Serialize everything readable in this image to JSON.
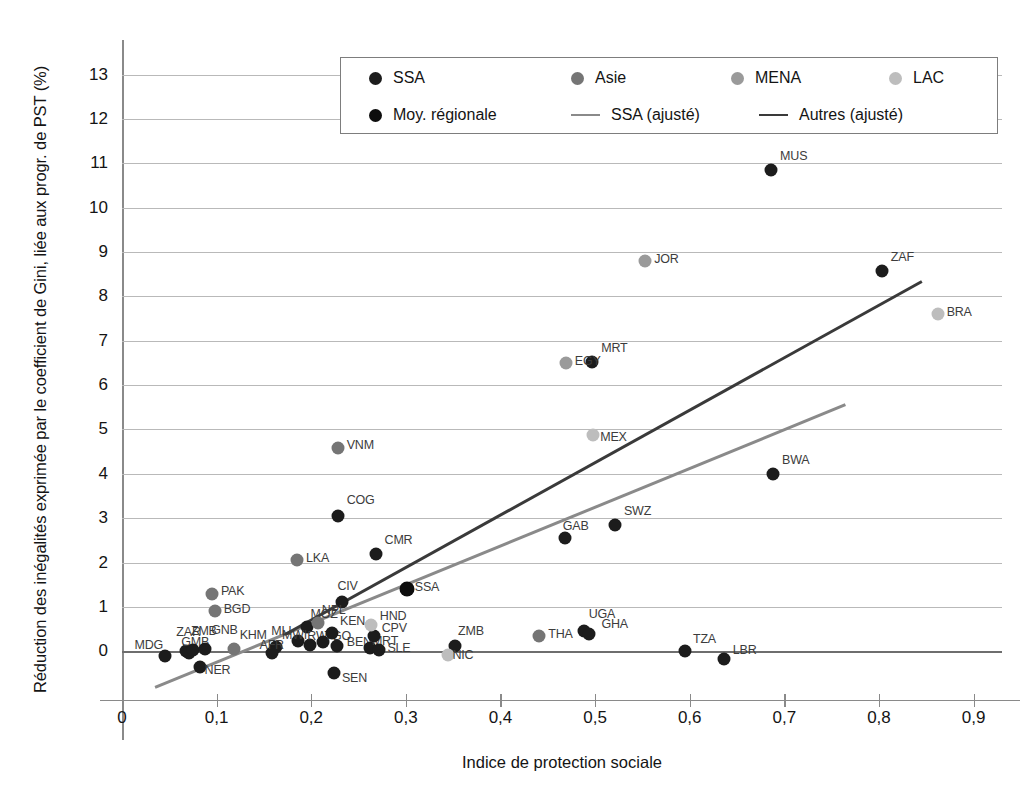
{
  "chart_data": {
    "type": "scatter",
    "title": "",
    "xlabel": "Indice de protection sociale",
    "ylabel": "Réduction des inégalités exprimée par le coefficient de Gini, liée aux progr. de PST (%)",
    "xlim": [
      0,
      0.93
    ],
    "ylim": [
      -1.1,
      13.4
    ],
    "xticks": [
      "0",
      "0,1",
      "0,2",
      "0,3",
      "0,4",
      "0,5",
      "0,6",
      "0,7",
      "0,8",
      "0,9"
    ],
    "xtick_values": [
      0,
      0.1,
      0.2,
      0.3,
      0.4,
      0.5,
      0.6,
      0.7,
      0.8,
      0.9
    ],
    "yticks": [
      "0",
      "1",
      "2",
      "3",
      "4",
      "5",
      "6",
      "7",
      "8",
      "9",
      "10",
      "11",
      "12",
      "13"
    ],
    "ytick_values": [
      0,
      1,
      2,
      3,
      4,
      5,
      6,
      7,
      8,
      9,
      10,
      11,
      12,
      13
    ],
    "grid": true,
    "legend_position": "top-center",
    "colors": {
      "SSA": "#1c1c1c",
      "Asie": "#757575",
      "MENA": "#9a9a9a",
      "LAC": "#bdbdbd",
      "Moy. régionale": "#0d0d0d",
      "SSA (ajusté)": "#8a8a8a",
      "Autres (ajusté)": "#3a3a3a"
    },
    "legend": [
      {
        "label": "SSA",
        "type": "dot",
        "color": "#1c1c1c"
      },
      {
        "label": "Asie",
        "type": "dot",
        "color": "#757575"
      },
      {
        "label": "MENA",
        "type": "dot",
        "color": "#9a9a9a"
      },
      {
        "label": "LAC",
        "type": "dot",
        "color": "#bdbdbd"
      },
      {
        "label": "Moy. régionale",
        "type": "dot",
        "color": "#0d0d0d"
      },
      {
        "label": "SSA (ajusté)",
        "type": "line",
        "color": "#8a8a8a"
      },
      {
        "label": "Autres (ajusté)",
        "type": "line",
        "color": "#3a3a3a"
      }
    ],
    "series": [
      {
        "name": "SSA",
        "color": "#1c1c1c",
        "points": [
          {
            "label": "MDG",
            "x": 0.045,
            "y": -0.1,
            "lx": -30,
            "ly": -11
          },
          {
            "label": "ZAR",
            "x": 0.068,
            "y": 0.0,
            "lx": -10,
            "ly": -19
          },
          {
            "label": "GMB",
            "x": 0.071,
            "y": -0.05,
            "lx": -8,
            "ly": -11
          },
          {
            "label": "ZMB2",
            "x": 0.075,
            "y": 0.02,
            "lx": -2,
            "ly": -19
          },
          {
            "label": "NER",
            "x": 0.082,
            "y": -0.35,
            "lx": 5,
            "ly": 3
          },
          {
            "label": "GNB",
            "x": 0.088,
            "y": 0.05,
            "lx": 6,
            "ly": -19
          },
          {
            "label": "MLI",
            "x": 0.163,
            "y": 0.1,
            "lx": -5,
            "ly": -16
          },
          {
            "label": "AFR",
            "x": 0.158,
            "y": -0.05,
            "lx": -12,
            "ly": -8
          },
          {
            "label": "MOZ",
            "x": 0.196,
            "y": 0.55,
            "lx": 3,
            "ly": -13
          },
          {
            "label": "RWA",
            "x": 0.199,
            "y": 0.15,
            "lx": -3,
            "ly": -9
          },
          {
            "label": "MWI",
            "x": 0.186,
            "y": 0.22,
            "lx": -16,
            "ly": -6
          },
          {
            "label": "TGO",
            "x": 0.212,
            "y": 0.2,
            "lx": 2,
            "ly": -6
          },
          {
            "label": "KEN",
            "x": 0.222,
            "y": 0.4,
            "lx": 8,
            "ly": -12
          },
          {
            "label": "BEN",
            "x": 0.227,
            "y": 0.12,
            "lx": 10,
            "ly": -4
          },
          {
            "label": "CIV",
            "x": 0.233,
            "y": 1.1,
            "lx": -5,
            "ly": -16
          },
          {
            "label": "SEN",
            "x": 0.224,
            "y": -0.5,
            "lx": 8,
            "ly": 5
          },
          {
            "label": "COG",
            "x": 0.228,
            "y": 3.05,
            "lx": 9,
            "ly": -16
          },
          {
            "label": "CMR",
            "x": 0.268,
            "y": 2.2,
            "lx": 9,
            "ly": -14
          },
          {
            "label": "MRT2",
            "x": 0.262,
            "y": 0.08,
            "lx": 2,
            "ly": -7
          },
          {
            "label": "SLE",
            "x": 0.272,
            "y": 0.02,
            "lx": 8,
            "ly": -2
          },
          {
            "label": "CPV",
            "x": 0.266,
            "y": 0.35,
            "lx": 8,
            "ly": -8
          },
          {
            "label": "ZMB",
            "x": 0.352,
            "y": 0.12,
            "lx": 3,
            "ly": -15
          },
          {
            "label": "UGA",
            "x": 0.488,
            "y": 0.45,
            "lx": 5,
            "ly": -17
          },
          {
            "label": "GHA",
            "x": 0.494,
            "y": 0.38,
            "lx": 12,
            "ly": -10
          },
          {
            "label": "TZA",
            "x": 0.595,
            "y": 0.0,
            "lx": 8,
            "ly": -12
          },
          {
            "label": "LBR",
            "x": 0.636,
            "y": -0.18,
            "lx": 9,
            "ly": -9
          },
          {
            "label": "GAB",
            "x": 0.468,
            "y": 2.55,
            "lx": -2,
            "ly": -12
          },
          {
            "label": "SWZ",
            "x": 0.521,
            "y": 2.85,
            "lx": 9,
            "ly": -14
          },
          {
            "label": "MRT",
            "x": 0.497,
            "y": 6.52,
            "lx": 9,
            "ly": -14
          },
          {
            "label": "BWA",
            "x": 0.688,
            "y": 4.0,
            "lx": 9,
            "ly": -14
          },
          {
            "label": "ZAF",
            "x": 0.803,
            "y": 8.58,
            "lx": 9,
            "ly": -14
          },
          {
            "label": "MUS",
            "x": 0.686,
            "y": 10.85,
            "lx": 9,
            "ly": -14
          }
        ]
      },
      {
        "name": "Asie",
        "color": "#757575",
        "points": [
          {
            "label": "PAK",
            "x": 0.095,
            "y": 1.3,
            "lx": 9,
            "ly": -3
          },
          {
            "label": "BGD",
            "x": 0.098,
            "y": 0.9,
            "lx": 9,
            "ly": -2
          },
          {
            "label": "LKA",
            "x": 0.185,
            "y": 2.05,
            "lx": 9,
            "ly": -2
          },
          {
            "label": "NPL",
            "x": 0.207,
            "y": 0.63,
            "lx": 4,
            "ly": -13
          },
          {
            "label": "VNM",
            "x": 0.228,
            "y": 4.58,
            "lx": 9,
            "ly": -3
          },
          {
            "label": "THA",
            "x": 0.441,
            "y": 0.35,
            "lx": 9,
            "ly": -2
          },
          {
            "label": "KHM",
            "x": 0.118,
            "y": 0.05,
            "lx": 6,
            "ly": -14
          }
        ]
      },
      {
        "name": "MENA",
        "color": "#9a9a9a",
        "points": [
          {
            "label": "EGY",
            "x": 0.469,
            "y": 6.5,
            "lx": 9,
            "ly": -2
          },
          {
            "label": "JOR",
            "x": 0.553,
            "y": 8.8,
            "lx": 9,
            "ly": -2
          }
        ]
      },
      {
        "name": "LAC",
        "color": "#bdbdbd",
        "points": [
          {
            "label": "HND",
            "x": 0.263,
            "y": 0.6,
            "lx": 9,
            "ly": -9
          },
          {
            "label": "NIC",
            "x": 0.344,
            "y": -0.08,
            "lx": 5,
            "ly": 0
          },
          {
            "label": "MEX",
            "x": 0.498,
            "y": 4.88,
            "lx": 7,
            "ly": 2
          },
          {
            "label": "BRA",
            "x": 0.862,
            "y": 7.6,
            "lx": 9,
            "ly": -2
          }
        ]
      },
      {
        "name": "Moy. régionale",
        "color": "#0d0d0d",
        "points": [
          {
            "label": "SSA",
            "x": 0.301,
            "y": 1.4,
            "lx": 8,
            "ly": -2
          }
        ]
      }
    ],
    "trendlines": [
      {
        "name": "SSA (ajusté)",
        "color": "#8a8a8a",
        "x0": 0.035,
        "y0": -0.78,
        "x1": 0.765,
        "y1": 5.6
      },
      {
        "name": "Autres (ajusté)",
        "color": "#3a3a3a",
        "x0": 0.172,
        "y0": 0.42,
        "x1": 0.845,
        "y1": 8.38
      }
    ]
  }
}
